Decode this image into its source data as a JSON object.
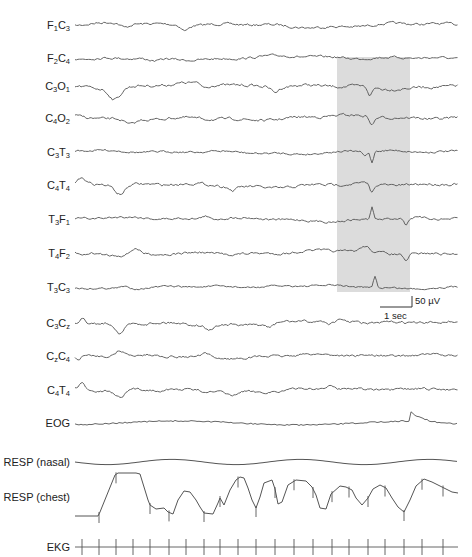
{
  "figure": {
    "type": "polysomnogram",
    "highlight": {
      "x": 337,
      "y": 57,
      "width": 73,
      "height": 235,
      "color": "#dcdcdc"
    },
    "trace_color": "#555555",
    "trace_x_start": 75,
    "trace_x_end": 458
  },
  "channels": [
    {
      "id": "F1C3",
      "parts": [
        [
          "F",
          "1"
        ],
        [
          "C",
          "3"
        ]
      ],
      "y": 25
    },
    {
      "id": "F2C4",
      "parts": [
        [
          "F",
          "2"
        ],
        [
          "C",
          "4"
        ]
      ],
      "y": 58
    },
    {
      "id": "C3O1",
      "parts": [
        [
          "C",
          "3"
        ],
        [
          "O",
          "1"
        ]
      ],
      "y": 86
    },
    {
      "id": "C4O2",
      "parts": [
        [
          "C",
          "4"
        ],
        [
          "O",
          "2"
        ]
      ],
      "y": 118
    },
    {
      "id": "C3T3",
      "parts": [
        [
          "C",
          "3"
        ],
        [
          "T",
          "3"
        ]
      ],
      "y": 152
    },
    {
      "id": "C4T4",
      "parts": [
        [
          "C",
          "4"
        ],
        [
          "T",
          "4"
        ]
      ],
      "y": 185
    },
    {
      "id": "T3F1",
      "parts": [
        [
          "T",
          "3"
        ],
        [
          "F",
          "1"
        ]
      ],
      "y": 219
    },
    {
      "id": "T4F2",
      "parts": [
        [
          "T",
          "4"
        ],
        [
          "F",
          "2"
        ]
      ],
      "y": 253
    },
    {
      "id": "T3C3",
      "parts": [
        [
          "T",
          "3"
        ],
        [
          "C",
          "3"
        ]
      ],
      "y": 287
    },
    {
      "id": "C3Cz",
      "parts": [
        [
          "C",
          "3"
        ],
        [
          "C",
          "z"
        ]
      ],
      "y": 323
    },
    {
      "id": "CzC4",
      "parts": [
        [
          "C",
          "z"
        ],
        [
          "C",
          "4"
        ]
      ],
      "y": 356
    },
    {
      "id": "C4T4b",
      "parts": [
        [
          "C",
          "4"
        ],
        [
          "T",
          "4"
        ]
      ],
      "y": 390
    },
    {
      "id": "EOG",
      "text": "EOG",
      "y": 423
    },
    {
      "id": "RESP-nasal",
      "text": "RESP (nasal)",
      "y": 462
    },
    {
      "id": "RESP-chest",
      "text": "RESP (chest)",
      "y": 497
    },
    {
      "id": "EKG",
      "text": "EKG",
      "y": 547
    }
  ],
  "scale_bar": {
    "amplitude_label": "50 µV",
    "time_label": "1 sec",
    "x_left": 380,
    "x_right": 412,
    "y_bottom": 307,
    "y_top": 296
  }
}
